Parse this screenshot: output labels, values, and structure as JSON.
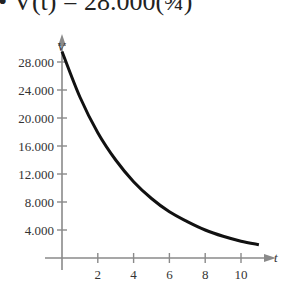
{
  "title_display": "• V(t) = 28.000(¾)",
  "chart_data": {
    "type": "line",
    "xlabel": "t",
    "ylabel": "V",
    "xlim": [
      0,
      11
    ],
    "ylim": [
      0,
      30000
    ],
    "x_ticks": [
      2,
      4,
      6,
      8,
      10
    ],
    "x_tick_labels": [
      "2",
      "4",
      "6",
      "8",
      "10"
    ],
    "y_ticks": [
      4000,
      8000,
      12000,
      16000,
      20000,
      24000,
      28000
    ],
    "y_tick_labels": [
      "4.000",
      "8.000",
      "12.000",
      "16.000",
      "20.000",
      "24.000",
      "28.000"
    ],
    "grid": false,
    "legend": null,
    "series": [
      {
        "name": "V(t)",
        "x": [
          0,
          1,
          2,
          3,
          4,
          5,
          6,
          7,
          8,
          9,
          10,
          11
        ],
        "values": [
          29500,
          23000,
          17900,
          14000,
          10900,
          8500,
          6600,
          5200,
          4000,
          3100,
          2400,
          1900
        ]
      }
    ],
    "colors": {
      "curve": "#111111",
      "axes": "#8a8a8a"
    }
  }
}
